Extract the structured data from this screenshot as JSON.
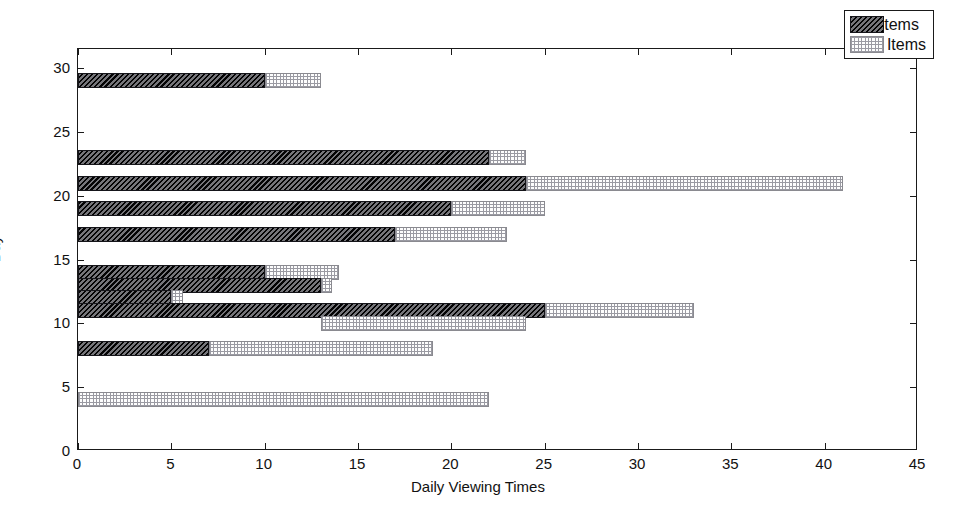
{
  "chart_data": {
    "type": "bar",
    "orientation": "horizontal",
    "stacked": true,
    "title": "",
    "xlabel": "Daily Viewing Times",
    "ylabel": "Day",
    "xlim": [
      0,
      45
    ],
    "ylim": [
      0,
      31.5
    ],
    "xticks": [
      0,
      5,
      10,
      15,
      20,
      25,
      30,
      35,
      40,
      45
    ],
    "yticks": [
      0,
      5,
      10,
      15,
      20,
      25,
      30
    ],
    "grid": false,
    "legend": {
      "position": "top-right",
      "entries": [
        {
          "label": "Old Items",
          "pattern": "dark-hatched",
          "color": "#3a3a40"
        },
        {
          "label": "New Items",
          "pattern": "light-dotted",
          "color": "#fdfdfd"
        }
      ]
    },
    "series": [
      {
        "name": "Old Items",
        "key": "old"
      },
      {
        "name": "New Items",
        "key": "new"
      }
    ],
    "categories": [
      29,
      23,
      21,
      19,
      17,
      14,
      13,
      12,
      11,
      10,
      8,
      4
    ],
    "bars": [
      {
        "day": 29,
        "old_start": 0,
        "old_end": 10,
        "new_start": 10,
        "new_end": 13
      },
      {
        "day": 23,
        "old_start": 0,
        "old_end": 22,
        "new_start": 22,
        "new_end": 24
      },
      {
        "day": 21,
        "old_start": 0,
        "old_end": 24,
        "new_start": 24,
        "new_end": 41
      },
      {
        "day": 19,
        "old_start": 0,
        "old_end": 20,
        "new_start": 20,
        "new_end": 25
      },
      {
        "day": 17,
        "old_start": 0,
        "old_end": 17,
        "new_start": 17,
        "new_end": 23
      },
      {
        "day": 14,
        "old_start": 0,
        "old_end": 10,
        "new_start": 10,
        "new_end": 14
      },
      {
        "day": 13,
        "old_start": 0,
        "old_end": 13,
        "new_start": 13,
        "new_end": 13.6
      },
      {
        "day": 12,
        "old_start": 0,
        "old_end": 5,
        "new_start": 5,
        "new_end": 5.6
      },
      {
        "day": 11,
        "old_start": 0,
        "old_end": 25,
        "new_start": 25,
        "new_end": 33
      },
      {
        "day": 10,
        "old_start": 0,
        "old_end": 0,
        "new_start": 13,
        "new_end": 24
      },
      {
        "day": 8,
        "old_start": 0,
        "old_end": 7,
        "new_start": 7,
        "new_end": 19
      },
      {
        "day": 4,
        "old_start": 0,
        "old_end": 0,
        "new_start": 0,
        "new_end": 22
      }
    ],
    "values": {
      "Old Items": [
        10,
        22,
        24,
        20,
        17,
        10,
        13,
        5,
        25,
        0,
        7,
        0
      ],
      "New Items": [
        3,
        2,
        17,
        5,
        6,
        4,
        0.6,
        0.6,
        8,
        11,
        12,
        22
      ]
    },
    "totals": [
      13,
      24,
      41,
      25,
      23,
      14,
      13.6,
      5.6,
      33,
      24,
      19,
      22
    ]
  }
}
